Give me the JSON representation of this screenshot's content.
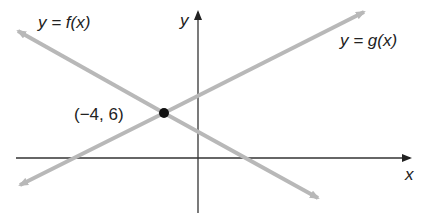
{
  "diagram": {
    "type": "line-intersection",
    "axes": {
      "x_label": "x",
      "y_label": "y"
    },
    "lines": [
      {
        "name": "f",
        "label": "y = f(x)",
        "color": "#b8b8b8",
        "slope": "negative"
      },
      {
        "name": "g",
        "label": "y = g(x)",
        "color": "#b8b8b8",
        "slope": "positive"
      }
    ],
    "intersection": {
      "label": "(−4, 6)",
      "x": -4,
      "y": 6
    }
  }
}
